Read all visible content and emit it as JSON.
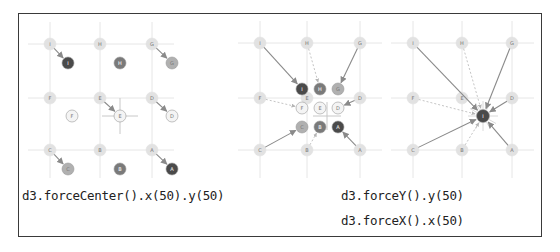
{
  "captions": {
    "left": "d3.forceCenter().x(50).y(50)",
    "right_line1": "d3.forceY().y(50)",
    "right_line2": "d3.forceX().x(50)"
  },
  "colors": {
    "frame": "#3a3a3a",
    "grid": "#e6e6e6",
    "ghost_node": "#e2e2e2",
    "arrow": "#8a8a8a",
    "dashed": "#b5b5b5",
    "node_dark": "#4a4a4a",
    "node_mid": "#7a7a7a",
    "node_light": "#b0b0b0",
    "node_white": "#f4f4f4"
  },
  "panels": [
    {
      "name": "force-center",
      "grid_x": [
        50,
        100,
        152
      ],
      "grid_y": [
        44,
        98,
        150
      ],
      "ghosts": [
        {
          "x": 50,
          "y": 44,
          "label": "I"
        },
        {
          "x": 100,
          "y": 44,
          "label": "H"
        },
        {
          "x": 152,
          "y": 44,
          "label": "G"
        },
        {
          "x": 50,
          "y": 98,
          "label": "F"
        },
        {
          "x": 100,
          "y": 98,
          "label": "E"
        },
        {
          "x": 152,
          "y": 98,
          "label": "D"
        },
        {
          "x": 50,
          "y": 150,
          "label": "C"
        },
        {
          "x": 100,
          "y": 150,
          "label": "B"
        },
        {
          "x": 152,
          "y": 150,
          "label": "A"
        }
      ],
      "nodes": [
        {
          "x": 68,
          "y": 63,
          "label": "I",
          "fill": "node_dark",
          "arrow": true
        },
        {
          "x": 120,
          "y": 63,
          "label": "H",
          "fill": "node_mid",
          "arrow": false
        },
        {
          "x": 172,
          "y": 63,
          "label": "G",
          "fill": "node_light",
          "arrow": true
        },
        {
          "x": 72,
          "y": 116,
          "label": "F",
          "fill": "node_white",
          "arrow": false
        },
        {
          "x": 120,
          "y": 116,
          "label": "E",
          "fill": "node_white",
          "arrow": true,
          "crosshair": true
        },
        {
          "x": 172,
          "y": 116,
          "label": "D",
          "fill": "node_white",
          "arrow": true
        },
        {
          "x": 68,
          "y": 169,
          "label": "C",
          "fill": "node_light",
          "arrow": true
        },
        {
          "x": 120,
          "y": 169,
          "label": "B",
          "fill": "node_mid",
          "arrow": false
        },
        {
          "x": 172,
          "y": 169,
          "label": "A",
          "fill": "node_dark",
          "arrow": true
        }
      ]
    },
    {
      "name": "force-xy-cluster",
      "grid_x": [
        260,
        307,
        360
      ],
      "grid_y": [
        43,
        98,
        150
      ],
      "ghosts": [
        {
          "x": 260,
          "y": 43,
          "label": "I"
        },
        {
          "x": 307,
          "y": 43,
          "label": "H"
        },
        {
          "x": 360,
          "y": 43,
          "label": "G"
        },
        {
          "x": 260,
          "y": 98,
          "label": "F"
        },
        {
          "x": 307,
          "y": 98,
          "label": "E"
        },
        {
          "x": 360,
          "y": 98,
          "label": "D"
        },
        {
          "x": 260,
          "y": 150,
          "label": "C"
        },
        {
          "x": 307,
          "y": 150,
          "label": "B"
        },
        {
          "x": 360,
          "y": 150,
          "label": "A"
        }
      ],
      "target": {
        "x": 327,
        "y": 116
      },
      "nodes": [
        {
          "x": 302,
          "y": 89,
          "label": "I",
          "fill": "node_dark",
          "arrow": "solid"
        },
        {
          "x": 320,
          "y": 89,
          "label": "H",
          "fill": "node_mid",
          "arrow": "dashed"
        },
        {
          "x": 338,
          "y": 89,
          "label": "G",
          "fill": "node_light",
          "arrow": "solid"
        },
        {
          "x": 302,
          "y": 108,
          "label": "F",
          "fill": "node_white",
          "arrow": "dashed"
        },
        {
          "x": 320,
          "y": 108,
          "label": "E",
          "fill": "node_white",
          "arrow": "none"
        },
        {
          "x": 338,
          "y": 108,
          "label": "D",
          "fill": "node_white",
          "arrow": "solid"
        },
        {
          "x": 302,
          "y": 127,
          "label": "C",
          "fill": "node_light",
          "arrow": "solid"
        },
        {
          "x": 320,
          "y": 127,
          "label": "B",
          "fill": "node_mid",
          "arrow": "dashed"
        },
        {
          "x": 338,
          "y": 127,
          "label": "A",
          "fill": "node_dark",
          "arrow": "solid"
        }
      ]
    },
    {
      "name": "force-xy-collapse",
      "grid_x": [
        413,
        462,
        512
      ],
      "grid_y": [
        43,
        98,
        150
      ],
      "ghosts": [
        {
          "x": 413,
          "y": 43,
          "label": "I"
        },
        {
          "x": 462,
          "y": 43,
          "label": "H"
        },
        {
          "x": 512,
          "y": 43,
          "label": "G"
        },
        {
          "x": 413,
          "y": 98,
          "label": "F"
        },
        {
          "x": 462,
          "y": 98,
          "label": "E"
        },
        {
          "x": 512,
          "y": 98,
          "label": "D"
        },
        {
          "x": 413,
          "y": 150,
          "label": "C"
        },
        {
          "x": 462,
          "y": 150,
          "label": "B"
        },
        {
          "x": 512,
          "y": 150,
          "label": "A"
        }
      ],
      "target": {
        "x": 483,
        "y": 116,
        "label": "I"
      },
      "arrow_styles": [
        "solid",
        "dashed",
        "solid",
        "dashed",
        "none",
        "solid",
        "solid",
        "dashed",
        "solid"
      ]
    }
  ]
}
